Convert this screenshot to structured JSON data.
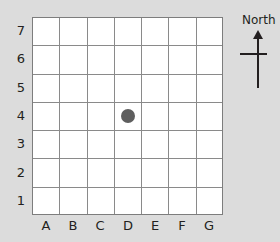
{
  "diagram": {
    "type": "grid-map",
    "columns": [
      "A",
      "B",
      "C",
      "D",
      "E",
      "F",
      "G"
    ],
    "rows": [
      "7",
      "6",
      "5",
      "4",
      "3",
      "2",
      "1"
    ],
    "marker": {
      "column": "D",
      "row": "4",
      "color": "#5e5e5e"
    },
    "compass": {
      "label": "North"
    },
    "colors": {
      "background": "#dcdcdc",
      "grid_fill": "#ffffff",
      "grid_line": "#8a8a8a"
    }
  }
}
